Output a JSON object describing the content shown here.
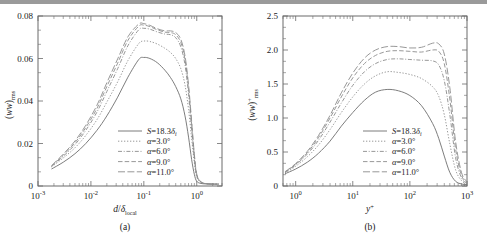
{
  "figure": {
    "panels": [
      {
        "id": "a",
        "caption": "(a)",
        "xlabel_main": "d",
        "xlabel_slash": "/",
        "xlabel_delta": "δ",
        "xlabel_sub": "local",
        "ylabel_open": "(",
        "ylabel_var": "ww",
        "ylabel_close": ")",
        "ylabel_sub": "rms",
        "ylabel_sup": "",
        "xticks": [
          {
            "mant": "10",
            "exp": "-3"
          },
          {
            "mant": "10",
            "exp": "-2"
          },
          {
            "mant": "10",
            "exp": "-1"
          },
          {
            "mant": "10",
            "exp": "0"
          }
        ],
        "yticks": [
          "0",
          "0.02",
          "0.04",
          "0.06",
          "0.08"
        ]
      },
      {
        "id": "b",
        "caption": "(b)",
        "xlabel_main": "y",
        "xlabel_slash": "",
        "xlabel_delta": "",
        "xlabel_sub": "",
        "xlabel_sup": "+",
        "ylabel_open": "(",
        "ylabel_var": "ww",
        "ylabel_close": ")",
        "ylabel_sub": "rms",
        "ylabel_sup": "+",
        "xticks": [
          {
            "mant": "10",
            "exp": "0"
          },
          {
            "mant": "10",
            "exp": "1"
          },
          {
            "mant": "10",
            "exp": "2"
          },
          {
            "mant": "10",
            "exp": "3"
          }
        ],
        "yticks": [
          "0",
          "0.5",
          "1.0",
          "1.5",
          "2.0",
          "2.5"
        ]
      }
    ],
    "legend": [
      {
        "style": "solid",
        "sym": "S",
        "eq": "=18.3",
        "unit": "δ",
        "unitsub": "i",
        "deg": ""
      },
      {
        "style": "dotted",
        "sym": "α",
        "eq": "=3.0",
        "unit": "",
        "unitsub": "",
        "deg": "°"
      },
      {
        "style": "dashdot",
        "sym": "α",
        "eq": "=6.0",
        "unit": "",
        "unitsub": "",
        "deg": "°"
      },
      {
        "style": "dashed",
        "sym": "α",
        "eq": "=9.0",
        "unit": "",
        "unitsub": "",
        "deg": "°"
      },
      {
        "style": "longdash",
        "sym": "α",
        "eq": "=11.0",
        "unit": "",
        "unitsub": "",
        "deg": "°"
      }
    ],
    "colors": {
      "axis": "#6b6b6b",
      "curve": "#8a8a8a",
      "curve_solid": "#6e6e6e",
      "topband": "#9a9a9a",
      "text": "#1a1a1a"
    }
  },
  "chart_data": [
    {
      "type": "line",
      "panel": "a",
      "title": "",
      "xlabel": "d/δ_local",
      "ylabel": "(ww)_rms",
      "xscale": "log",
      "xlim": [
        0.001,
        3.0
      ],
      "ylim": [
        0,
        0.08
      ],
      "grid": false,
      "legend_position": "lower-center-right",
      "x": [
        0.0018,
        0.003,
        0.005,
        0.008,
        0.013,
        0.02,
        0.032,
        0.05,
        0.08,
        0.1,
        0.13,
        0.18,
        0.25,
        0.32,
        0.4,
        0.5,
        0.6,
        0.7,
        0.8,
        0.9,
        1.0,
        1.2,
        1.5,
        2.0,
        2.6
      ],
      "series": [
        {
          "name": "S=18.3δi",
          "style": "solid",
          "values": [
            0.008,
            0.0112,
            0.0152,
            0.02,
            0.0262,
            0.033,
            0.0418,
            0.0512,
            0.0595,
            0.0605,
            0.06,
            0.058,
            0.0545,
            0.051,
            0.0468,
            0.041,
            0.033,
            0.023,
            0.0125,
            0.0055,
            0.0022,
            0.0012,
            0.001,
            0.0009,
            0.0009
          ]
        },
        {
          "name": "α=3.0°",
          "style": "dotted",
          "values": [
            0.009,
            0.0132,
            0.018,
            0.0238,
            0.0312,
            0.0395,
            0.049,
            0.059,
            0.067,
            0.0682,
            0.068,
            0.0668,
            0.0648,
            0.0628,
            0.06,
            0.0552,
            0.0475,
            0.036,
            0.0225,
            0.011,
            0.0042,
            0.0016,
            0.0011,
            0.0009,
            0.0009
          ]
        },
        {
          "name": "α=6.0°",
          "style": "dashdot",
          "values": [
            0.0092,
            0.014,
            0.0195,
            0.0262,
            0.0348,
            0.0445,
            0.0552,
            0.066,
            0.0735,
            0.0742,
            0.0738,
            0.0725,
            0.0715,
            0.0712,
            0.0698,
            0.0655,
            0.057,
            0.043,
            0.0268,
            0.013,
            0.0048,
            0.0018,
            0.0011,
            0.0009,
            0.0009
          ]
        },
        {
          "name": "α=9.0°",
          "style": "dashed",
          "values": [
            0.0094,
            0.0145,
            0.0204,
            0.0275,
            0.0365,
            0.0468,
            0.0578,
            0.0685,
            0.0752,
            0.0757,
            0.075,
            0.0735,
            0.0724,
            0.0722,
            0.0712,
            0.0675,
            0.0595,
            0.0458,
            0.0292,
            0.0142,
            0.0052,
            0.0019,
            0.0011,
            0.0009,
            0.0009
          ]
        },
        {
          "name": "α=11.0°",
          "style": "longdash",
          "values": [
            0.0096,
            0.015,
            0.0212,
            0.0286,
            0.038,
            0.0486,
            0.0598,
            0.0702,
            0.0762,
            0.0764,
            0.0756,
            0.074,
            0.073,
            0.073,
            0.0722,
            0.069,
            0.0612,
            0.0475,
            0.0305,
            0.015,
            0.0056,
            0.002,
            0.0011,
            0.0009,
            0.0009
          ]
        }
      ]
    },
    {
      "type": "line",
      "panel": "b",
      "title": "",
      "xlabel": "y+",
      "ylabel": "(ww)+_rms",
      "xscale": "log",
      "xlim": [
        0.6,
        1000
      ],
      "ylim": [
        0,
        2.5
      ],
      "grid": false,
      "legend_position": "lower-center-right",
      "x": [
        0.65,
        1.0,
        1.6,
        2.5,
        4.0,
        6.3,
        10,
        16,
        25,
        40,
        63,
        100,
        160,
        250,
        320,
        400,
        500,
        630,
        800,
        1000
      ],
      "series": [
        {
          "name": "S=18.3δi",
          "style": "solid",
          "values": [
            0.18,
            0.25,
            0.35,
            0.48,
            0.66,
            0.88,
            1.08,
            1.26,
            1.38,
            1.42,
            1.4,
            1.33,
            1.18,
            0.92,
            0.7,
            0.44,
            0.2,
            0.07,
            0.03,
            0.02
          ]
        },
        {
          "name": "α=3.0°",
          "style": "dotted",
          "values": [
            0.19,
            0.29,
            0.43,
            0.6,
            0.83,
            1.08,
            1.31,
            1.5,
            1.62,
            1.68,
            1.67,
            1.64,
            1.58,
            1.46,
            1.32,
            1.05,
            0.62,
            0.24,
            0.08,
            0.03
          ]
        },
        {
          "name": "α=6.0°",
          "style": "dashdot",
          "values": [
            0.2,
            0.31,
            0.47,
            0.67,
            0.94,
            1.22,
            1.48,
            1.68,
            1.8,
            1.86,
            1.87,
            1.86,
            1.85,
            1.84,
            1.78,
            1.55,
            1.05,
            0.42,
            0.12,
            0.04
          ]
        },
        {
          "name": "α=9.0°",
          "style": "dashed",
          "values": [
            0.2,
            0.32,
            0.49,
            0.71,
            1.0,
            1.31,
            1.59,
            1.8,
            1.92,
            1.98,
            1.99,
            1.98,
            1.97,
            2.0,
            1.98,
            1.8,
            1.28,
            0.55,
            0.16,
            0.05
          ]
        },
        {
          "name": "α=11.0°",
          "style": "longdash",
          "values": [
            0.21,
            0.33,
            0.51,
            0.74,
            1.04,
            1.37,
            1.66,
            1.88,
            2.0,
            2.05,
            2.05,
            2.03,
            2.04,
            2.1,
            2.09,
            1.94,
            1.45,
            0.66,
            0.2,
            0.06
          ]
        }
      ]
    }
  ]
}
